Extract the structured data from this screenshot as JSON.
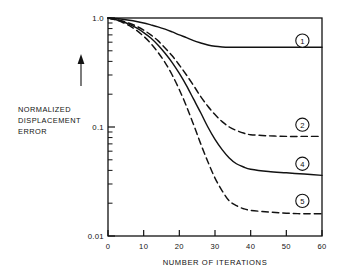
{
  "figure": {
    "y_axis_label_lines": [
      "NORMALIZED",
      "DISPLACEMENT",
      "ERROR"
    ],
    "x_axis_label": "NUMBER OF ITERATIONS",
    "arrow_icon": "up-arrow-icon"
  },
  "chart_data": {
    "type": "line",
    "title": "",
    "xlabel": "NUMBER OF ITERATIONS",
    "ylabel": "NORMALIZED DISPLACEMENT ERROR",
    "xlim": [
      0,
      60
    ],
    "ylim": [
      0.01,
      1.0
    ],
    "yscale": "log",
    "xscale": "linear",
    "grid": false,
    "legend": "inline-curve-labels",
    "xticks": [
      0,
      10,
      20,
      30,
      40,
      50,
      60
    ],
    "xticklabels": [
      "0",
      "10",
      "20",
      "30",
      "40",
      "50",
      "60"
    ],
    "yticks": [
      0.01,
      0.1,
      1.0
    ],
    "yticklabels": [
      "0.01",
      "0.1",
      "1.0"
    ],
    "yminorticks": [
      0.02,
      0.03,
      0.04,
      0.05,
      0.06,
      0.07,
      0.08,
      0.09,
      0.2,
      0.3,
      0.4,
      0.5,
      0.6,
      0.7,
      0.8,
      0.9
    ],
    "x": [
      0,
      2,
      4,
      6,
      8,
      10,
      12,
      14,
      16,
      18,
      20,
      22,
      24,
      26,
      28,
      30,
      32,
      34,
      36,
      38,
      40,
      45,
      50,
      55,
      60
    ],
    "series": [
      {
        "name": "1",
        "label": "1",
        "style": "solid",
        "plateau": 0.54,
        "values": [
          1.0,
          0.99,
          0.975,
          0.955,
          0.93,
          0.9,
          0.865,
          0.83,
          0.79,
          0.745,
          0.7,
          0.66,
          0.62,
          0.59,
          0.565,
          0.55,
          0.543,
          0.54,
          0.54,
          0.54,
          0.54,
          0.54,
          0.54,
          0.54,
          0.54
        ]
      },
      {
        "name": "2",
        "label": "2",
        "style": "dashed",
        "plateau": 0.082,
        "values": [
          1.0,
          0.975,
          0.94,
          0.895,
          0.84,
          0.775,
          0.7,
          0.62,
          0.53,
          0.45,
          0.37,
          0.3,
          0.24,
          0.19,
          0.155,
          0.13,
          0.112,
          0.1,
          0.093,
          0.088,
          0.085,
          0.083,
          0.082,
          0.082,
          0.082
        ]
      },
      {
        "name": "4",
        "label": "4",
        "style": "solid",
        "plateau": 0.036,
        "values": [
          1.0,
          0.97,
          0.93,
          0.875,
          0.81,
          0.735,
          0.655,
          0.565,
          0.475,
          0.39,
          0.31,
          0.24,
          0.18,
          0.135,
          0.1,
          0.077,
          0.062,
          0.052,
          0.046,
          0.043,
          0.041,
          0.039,
          0.038,
          0.037,
          0.036
        ]
      },
      {
        "name": "5",
        "label": "5",
        "style": "dashed",
        "plateau": 0.016,
        "values": [
          1.0,
          0.965,
          0.915,
          0.85,
          0.77,
          0.68,
          0.585,
          0.485,
          0.39,
          0.3,
          0.22,
          0.155,
          0.105,
          0.07,
          0.048,
          0.034,
          0.026,
          0.021,
          0.019,
          0.0178,
          0.0172,
          0.0166,
          0.0162,
          0.016,
          0.016
        ]
      }
    ],
    "curve_labels": [
      {
        "text": "1",
        "x": 54.5,
        "y": 0.62
      },
      {
        "text": "2",
        "x": 54.5,
        "y": 0.105
      },
      {
        "text": "4",
        "x": 54.5,
        "y": 0.046
      },
      {
        "text": "5",
        "x": 54.5,
        "y": 0.021
      }
    ]
  },
  "colors": {
    "ink": "#121212",
    "background": "#ffffff"
  }
}
